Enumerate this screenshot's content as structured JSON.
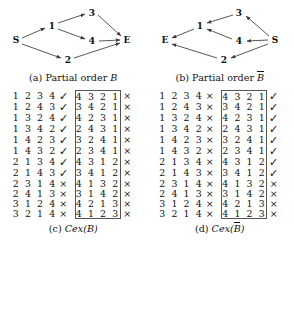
{
  "figure": {
    "panels": [
      {
        "id": "a",
        "caption_prefix": "(a)",
        "caption_text": "Partial order",
        "caption_symbol": "B",
        "caption_overline": false,
        "graph": {
          "nodes": [
            {
              "id": "S",
              "label": "S",
              "x": 16,
              "y": 40
            },
            {
              "id": "1",
              "label": "1",
              "x": 52,
              "y": 26
            },
            {
              "id": "2",
              "label": "2",
              "x": 68,
              "y": 60
            },
            {
              "id": "3",
              "label": "3",
              "x": 92,
              "y": 13
            },
            {
              "id": "4",
              "label": "4",
              "x": 92,
              "y": 41
            },
            {
              "id": "E",
              "label": "E",
              "x": 127,
              "y": 40
            }
          ],
          "edges": [
            {
              "from": "S",
              "to": "1"
            },
            {
              "from": "S",
              "to": "2"
            },
            {
              "from": "1",
              "to": "3"
            },
            {
              "from": "1",
              "to": "4"
            },
            {
              "from": "3",
              "to": "E"
            },
            {
              "from": "4",
              "to": "E"
            },
            {
              "from": "2",
              "to": "E"
            }
          ]
        }
      },
      {
        "id": "b",
        "caption_prefix": "(b)",
        "caption_text": "Partial order",
        "caption_symbol": "B",
        "caption_overline": true,
        "graph": {
          "nodes": [
            {
              "id": "E",
              "label": "E",
              "x": 18,
              "y": 40
            },
            {
              "id": "1",
              "label": "1",
              "x": 53,
              "y": 26
            },
            {
              "id": "2",
              "label": "2",
              "x": 77,
              "y": 60
            },
            {
              "id": "3",
              "label": "3",
              "x": 92,
              "y": 13
            },
            {
              "id": "4",
              "label": "4",
              "x": 92,
              "y": 41
            },
            {
              "id": "S",
              "label": "S",
              "x": 128,
              "y": 40
            }
          ],
          "edges": [
            {
              "from": "S",
              "to": "3"
            },
            {
              "from": "S",
              "to": "4"
            },
            {
              "from": "S",
              "to": "2"
            },
            {
              "from": "3",
              "to": "1"
            },
            {
              "from": "4",
              "to": "1"
            },
            {
              "from": "1",
              "to": "E"
            },
            {
              "from": "2",
              "to": "E"
            }
          ]
        }
      }
    ]
  },
  "tables": [
    {
      "id": "c",
      "caption_prefix": "(c)",
      "caption_fn": "Cex(",
      "caption_symbol": "B",
      "caption_overline": false,
      "caption_close": ")",
      "rows": [
        {
          "left_perm": "1 2 3 4",
          "left_mark": "check",
          "right_perm": "4 3 2 1",
          "right_mark": "cross"
        },
        {
          "left_perm": "1 2 4 3",
          "left_mark": "check",
          "right_perm": "3 4 2 1",
          "right_mark": "cross"
        },
        {
          "left_perm": "1 3 2 4",
          "left_mark": "check",
          "right_perm": "4 2 3 1",
          "right_mark": "cross"
        },
        {
          "left_perm": "1 3 4 2",
          "left_mark": "check",
          "right_perm": "2 4 3 1",
          "right_mark": "cross"
        },
        {
          "left_perm": "1 4 2 3",
          "left_mark": "check",
          "right_perm": "3 2 4 1",
          "right_mark": "cross"
        },
        {
          "left_perm": "1 4 3 2",
          "left_mark": "check",
          "right_perm": "2 3 4 1",
          "right_mark": "cross"
        },
        {
          "left_perm": "2 1 3 4",
          "left_mark": "check",
          "right_perm": "4 3 1 2",
          "right_mark": "cross"
        },
        {
          "left_perm": "2 1 4 3",
          "left_mark": "check",
          "right_perm": "3 4 1 2",
          "right_mark": "cross"
        },
        {
          "left_perm": "2 3 1 4",
          "left_mark": "cross",
          "right_perm": "4 1 3 2",
          "right_mark": "cross"
        },
        {
          "left_perm": "2 4 1 3",
          "left_mark": "cross",
          "right_perm": "3 1 4 2",
          "right_mark": "cross"
        },
        {
          "left_perm": "3 1 2 4",
          "left_mark": "cross",
          "right_perm": "4 2 1 3",
          "right_mark": "cross"
        },
        {
          "left_perm": "3 2 1 4",
          "left_mark": "cross",
          "right_perm": "4 1 2 3",
          "right_mark": "cross"
        }
      ]
    },
    {
      "id": "d",
      "caption_prefix": "(d)",
      "caption_fn": "Cex(",
      "caption_symbol": "B",
      "caption_overline": true,
      "caption_close": ")",
      "rows": [
        {
          "left_perm": "1 2 3 4",
          "left_mark": "cross",
          "right_perm": "4 3 2 1",
          "right_mark": "check"
        },
        {
          "left_perm": "1 2 4 3",
          "left_mark": "cross",
          "right_perm": "3 4 2 1",
          "right_mark": "check"
        },
        {
          "left_perm": "1 3 2 4",
          "left_mark": "cross",
          "right_perm": "4 2 3 1",
          "right_mark": "check"
        },
        {
          "left_perm": "1 3 4 2",
          "left_mark": "cross",
          "right_perm": "2 4 3 1",
          "right_mark": "check"
        },
        {
          "left_perm": "1 4 2 3",
          "left_mark": "cross",
          "right_perm": "3 2 4 1",
          "right_mark": "check"
        },
        {
          "left_perm": "1 4 3 2",
          "left_mark": "cross",
          "right_perm": "2 3 4 1",
          "right_mark": "check"
        },
        {
          "left_perm": "2 1 3 4",
          "left_mark": "cross",
          "right_perm": "4 3 1 2",
          "right_mark": "check"
        },
        {
          "left_perm": "2 1 4 3",
          "left_mark": "cross",
          "right_perm": "3 4 1 2",
          "right_mark": "check"
        },
        {
          "left_perm": "2 3 1 4",
          "left_mark": "cross",
          "right_perm": "4 1 3 2",
          "right_mark": "cross"
        },
        {
          "left_perm": "2 4 1 3",
          "left_mark": "cross",
          "right_perm": "3 1 4 2",
          "right_mark": "cross"
        },
        {
          "left_perm": "3 1 2 4",
          "left_mark": "cross",
          "right_perm": "4 2 1 3",
          "right_mark": "cross"
        },
        {
          "left_perm": "3 2 1 4",
          "left_mark": "cross",
          "right_perm": "4 1 2 3",
          "right_mark": "cross"
        }
      ]
    }
  ],
  "glyphs": {
    "check": "✓",
    "cross": "×"
  },
  "colors": {
    "text": "#111111",
    "box_border": "#555555",
    "edge": "#3a3a3a"
  }
}
